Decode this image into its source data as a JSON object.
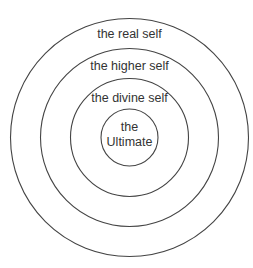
{
  "diagram": {
    "type": "concentric-circles",
    "stroke_color": "#444444",
    "text_color": "#333333",
    "center": [
      129.5,
      137.5
    ],
    "rings": [
      {
        "id": "outer",
        "label": "the real self",
        "radius": 119
      },
      {
        "id": "second",
        "label": "the higher self",
        "radius": 89
      },
      {
        "id": "third",
        "label": "the divine self",
        "radius": 59
      },
      {
        "id": "core",
        "label_line1": "the",
        "label_line2": "Ultimate",
        "radius": 28.5
      }
    ]
  }
}
